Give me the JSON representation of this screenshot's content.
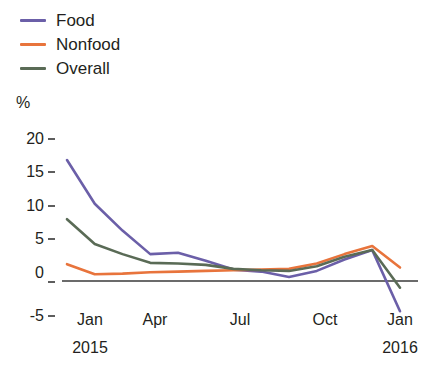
{
  "chart_data": {
    "type": "line",
    "title": "",
    "xlabel": "",
    "ylabel": "%",
    "ylim": [
      -5,
      20
    ],
    "yticks": [
      20,
      15,
      10,
      5,
      0,
      -5
    ],
    "ytick_labels": [
      "20",
      "15",
      "10",
      "5",
      "0",
      "-5"
    ],
    "grid": false,
    "zero_line": true,
    "legend_position": "top-left",
    "x": [
      "Jan 2015",
      "Feb 2015",
      "Mar 2015",
      "Apr 2015",
      "May 2015",
      "Jun 2015",
      "Jul 2015",
      "Aug 2015",
      "Sep 2015",
      "Oct 2015",
      "Nov 2015",
      "Dec 2015",
      "Jan 2016"
    ],
    "xtick_labels": [
      "Jan",
      "Apr",
      "Jul",
      "Oct",
      "Jan"
    ],
    "xtick_years": [
      "2015",
      "",
      "",
      "",
      "2016"
    ],
    "xtick_indices": [
      0,
      3,
      6,
      9,
      12
    ],
    "series": [
      {
        "name": "Food",
        "color": "#6b5fa8",
        "values": [
          18.0,
          11.5,
          7.5,
          4.0,
          4.2,
          3.0,
          1.7,
          1.4,
          0.6,
          1.5,
          3.2,
          4.6,
          -4.5
        ]
      },
      {
        "name": "Nonfood",
        "color": "#e8743c",
        "values": [
          2.5,
          1.0,
          1.1,
          1.3,
          1.4,
          1.5,
          1.6,
          1.7,
          1.8,
          2.6,
          4.0,
          5.2,
          2.0
        ]
      },
      {
        "name": "Overall",
        "color": "#5a6b56",
        "values": [
          9.2,
          5.5,
          4.0,
          2.7,
          2.6,
          2.4,
          1.8,
          1.6,
          1.5,
          2.2,
          3.6,
          4.6,
          -1.0
        ]
      }
    ]
  },
  "legend": {
    "items": [
      {
        "label": "Food",
        "color": "#6b5fa8"
      },
      {
        "label": "Nonfood",
        "color": "#e8743c"
      },
      {
        "label": "Overall",
        "color": "#5a6b56"
      }
    ]
  },
  "axes": {
    "unit_label": "%",
    "y_ticks": [
      "20",
      "15",
      "10",
      "5",
      "0",
      "-5"
    ],
    "x_ticks": [
      "Jan",
      "Apr",
      "Jul",
      "Oct",
      "Jan"
    ],
    "x_years_left": "2015",
    "x_years_right": "2016"
  },
  "colors": {
    "food": "#6b5fa8",
    "nonfood": "#e8743c",
    "overall": "#5a6b56",
    "axis": "#3a3a3a",
    "text": "#231f20"
  }
}
